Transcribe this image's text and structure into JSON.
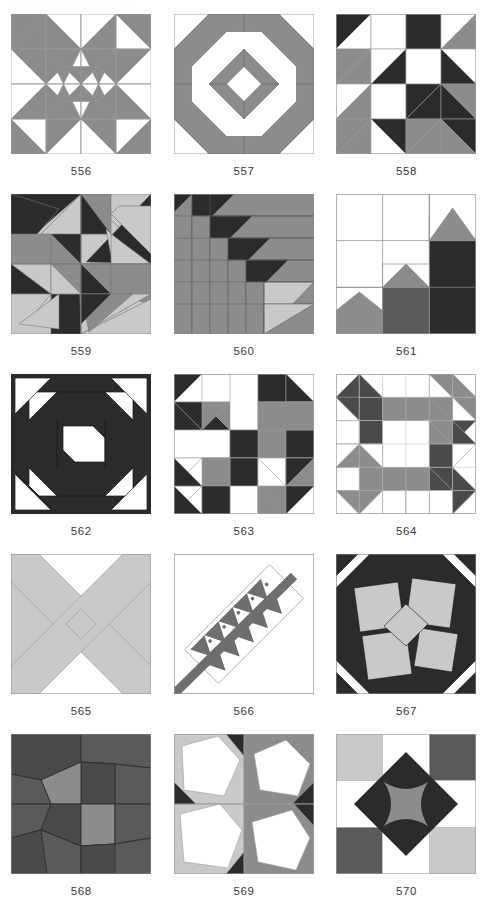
{
  "page": {
    "header_text": "QUILT BLOCK PATTERNS",
    "background": "#ffffff"
  },
  "palette": {
    "white": "#ffffff",
    "light_gray": "#c9c9c9",
    "mid_gray": "#8c8c8c",
    "dark_gray": "#5a5a5a",
    "near_black": "#2b2b2b",
    "outline": "#9a9a9a",
    "caption_color": "#3b3b3b"
  },
  "grid": {
    "columns": 3,
    "rows": 5,
    "block_size_px": 140
  },
  "blocks": [
    {
      "label": "556",
      "name": "block-556",
      "description": "Four-patch star with gray and white half-square triangles",
      "colors": [
        "#ffffff",
        "#8c8c8c"
      ]
    },
    {
      "label": "557",
      "name": "block-557",
      "description": "Concentric octagon frame with center diamond",
      "colors": [
        "#ffffff",
        "#8c8c8c"
      ]
    },
    {
      "label": "558",
      "name": "block-558",
      "description": "Sawtooth star with dark, mid and light grays",
      "colors": [
        "#ffffff",
        "#c9c9c9",
        "#8c8c8c",
        "#2b2b2b"
      ]
    },
    {
      "label": "559",
      "name": "block-559",
      "description": "Rotating pinwheel of long dark triangles",
      "colors": [
        "#c9c9c9",
        "#8c8c8c",
        "#2b2b2b"
      ]
    },
    {
      "label": "560",
      "name": "block-560",
      "description": "Nested diagonal flying geese steps",
      "colors": [
        "#c9c9c9",
        "#8c8c8c",
        "#2b2b2b"
      ]
    },
    {
      "label": "561",
      "name": "block-561",
      "description": "Staircase of three house shapes",
      "colors": [
        "#ffffff",
        "#8c8c8c",
        "#5a5a5a",
        "#2b2b2b"
      ]
    },
    {
      "label": "562",
      "name": "block-562",
      "description": "Dark churn dash with white corner triangles and center",
      "colors": [
        "#ffffff",
        "#2b2b2b"
      ]
    },
    {
      "label": "563",
      "name": "block-563",
      "description": "Nine patch with gray squares and dark diagonal sashing",
      "colors": [
        "#ffffff",
        "#8c8c8c",
        "#2b2b2b"
      ]
    },
    {
      "label": "564",
      "name": "block-564",
      "description": "Six by six grid star with mid and dark gray points",
      "colors": [
        "#ffffff",
        "#8c8c8c",
        "#4a4a4a"
      ]
    },
    {
      "label": "565",
      "name": "block-565",
      "description": "Large light gray X across white background",
      "colors": [
        "#ffffff",
        "#c9c9c9"
      ]
    },
    {
      "label": "566",
      "name": "block-566",
      "description": "Diagonal band of flying geese with dots and a wide stripe",
      "colors": [
        "#ffffff",
        "#6e6e6e"
      ]
    },
    {
      "label": "567",
      "name": "block-567",
      "description": "Tilted gray squares on black with center diamond",
      "colors": [
        "#ffffff",
        "#c9c9c9",
        "#2b2b2b"
      ]
    },
    {
      "label": "568",
      "name": "block-568",
      "description": "Radiating pinwheel of gray wedges",
      "colors": [
        "#8c8c8c",
        "#5a5a5a",
        "#4a4a4a"
      ]
    },
    {
      "label": "569",
      "name": "block-569",
      "description": "Four tilted white pentagons on gray ground",
      "colors": [
        "#ffffff",
        "#c9c9c9",
        "#8c8c8c",
        "#2b2b2b"
      ]
    },
    {
      "label": "570",
      "name": "block-570",
      "description": "Nine patch with dark diamond and gray astroid center",
      "colors": [
        "#ffffff",
        "#c9c9c9",
        "#5a5a5a",
        "#2b2b2b"
      ]
    }
  ]
}
